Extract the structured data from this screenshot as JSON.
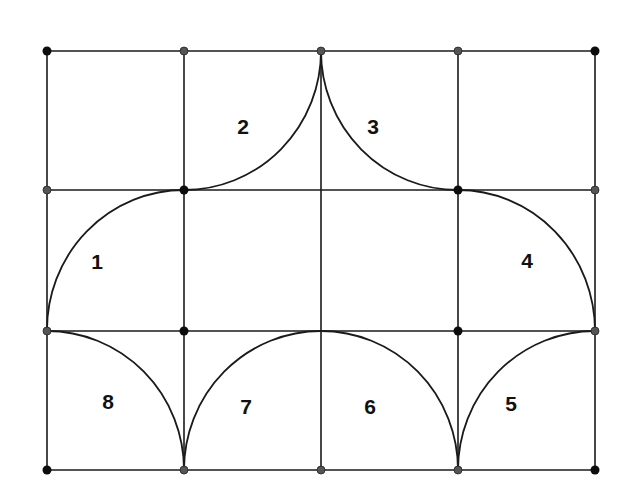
{
  "diagram": {
    "grid": {
      "columns": 4,
      "rows": 3
    },
    "regions": [
      {
        "label": "1"
      },
      {
        "label": "2"
      },
      {
        "label": "3"
      },
      {
        "label": "4"
      },
      {
        "label": "5"
      },
      {
        "label": "6"
      },
      {
        "label": "7"
      },
      {
        "label": "8"
      }
    ],
    "colors": {
      "line": "#1a1a1a",
      "dot_dark": "#0d0d0d",
      "dot_gray": "#555555",
      "background": "#ffffff"
    }
  }
}
